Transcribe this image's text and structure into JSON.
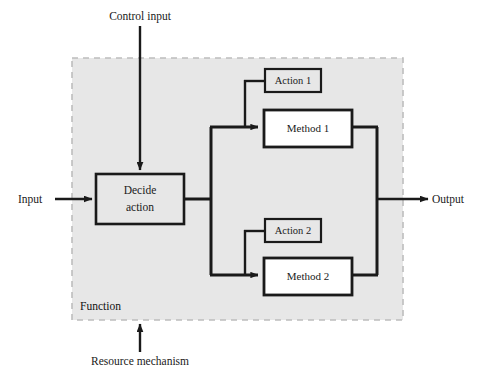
{
  "diagram": {
    "type": "idef0-function-decomposition",
    "colors": {
      "background": "#ffffff",
      "function_fill": "#e7e7e7",
      "function_border": "#b9b9b9",
      "box_stroke": "#1a1a1a",
      "box_fill_white": "#ffffff",
      "box_fill_gray": "#e7e7e7",
      "line": "#1a1a1a",
      "text": "#1a1a1a"
    },
    "container": {
      "label": "Function",
      "border_style": "dashed",
      "x": 72,
      "y": 58,
      "width": 331,
      "height": 262
    },
    "boxes": [
      {
        "id": "decide-action",
        "label_line1": "Decide",
        "label_line2": "action",
        "fill": "gray",
        "x": 96,
        "y": 174,
        "width": 88,
        "height": 50
      },
      {
        "id": "action-1",
        "label": "Action 1",
        "fill": "gray",
        "x": 265,
        "y": 69,
        "width": 56,
        "height": 23
      },
      {
        "id": "method-1",
        "label": "Method 1",
        "fill": "white",
        "x": 264,
        "y": 110,
        "width": 88,
        "height": 37
      },
      {
        "id": "action-2",
        "label": "Action 2",
        "fill": "gray",
        "x": 265,
        "y": 219,
        "width": 56,
        "height": 23
      },
      {
        "id": "method-2",
        "label": "Method 2",
        "fill": "white",
        "x": 264,
        "y": 258,
        "width": 88,
        "height": 37
      }
    ],
    "external_labels": {
      "control_input": "Control input",
      "input": "Input",
      "output": "Output",
      "resource_mechanism": "Resource mechanism"
    },
    "arrows": [
      {
        "id": "control-input-arrow",
        "from": "Control input",
        "to": "Decide action",
        "direction": "down"
      },
      {
        "id": "input-arrow",
        "from": "Input",
        "to": "Decide action",
        "direction": "right"
      },
      {
        "id": "output-arrow",
        "from": "Function",
        "to": "Output",
        "direction": "right"
      },
      {
        "id": "resource-mechanism-arrow",
        "from": "Resource mechanism",
        "to": "Function",
        "direction": "up"
      },
      {
        "id": "decide-to-method1-arrow",
        "from": "Decide action",
        "to": "Method 1",
        "direction": "right"
      },
      {
        "id": "decide-to-method2-arrow",
        "from": "Decide action",
        "to": "Method 2",
        "direction": "right"
      },
      {
        "id": "action1-to-method1-link",
        "from": "Action 1",
        "to": "Method 1 input",
        "direction": "down"
      },
      {
        "id": "action2-to-method2-link",
        "from": "Action 2",
        "to": "Method 2 input",
        "direction": "down"
      },
      {
        "id": "method1-to-output-link",
        "from": "Method 1",
        "to": "Output bus",
        "direction": "right"
      },
      {
        "id": "method2-to-output-link",
        "from": "Method 2",
        "to": "Output bus",
        "direction": "right"
      }
    ]
  }
}
